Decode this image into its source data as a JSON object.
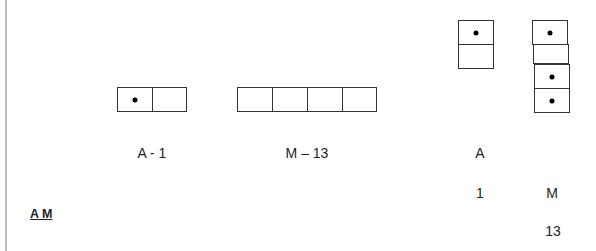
{
  "title": "A M",
  "groups": [
    {
      "name": "A-1",
      "label": "A - 1",
      "orientation": "horizontal",
      "cells": [
        {
          "dot": true
        },
        {
          "dot": false
        }
      ]
    },
    {
      "name": "M-13",
      "label": "M – 13",
      "orientation": "horizontal",
      "cells": [
        {
          "dot": false
        },
        {
          "dot": false
        },
        {
          "dot": false
        },
        {
          "dot": false
        }
      ]
    },
    {
      "name": "A-vertical",
      "label": "A",
      "sublabel": "1",
      "orientation": "vertical",
      "cells": [
        {
          "dot": true
        },
        {
          "dot": false
        }
      ]
    },
    {
      "name": "M-vertical",
      "label": "M",
      "sublabel": "13",
      "orientation": "vertical",
      "cells": [
        {
          "dot": true
        },
        {
          "dot": false
        },
        {
          "dot": true
        },
        {
          "dot": true
        }
      ]
    }
  ]
}
